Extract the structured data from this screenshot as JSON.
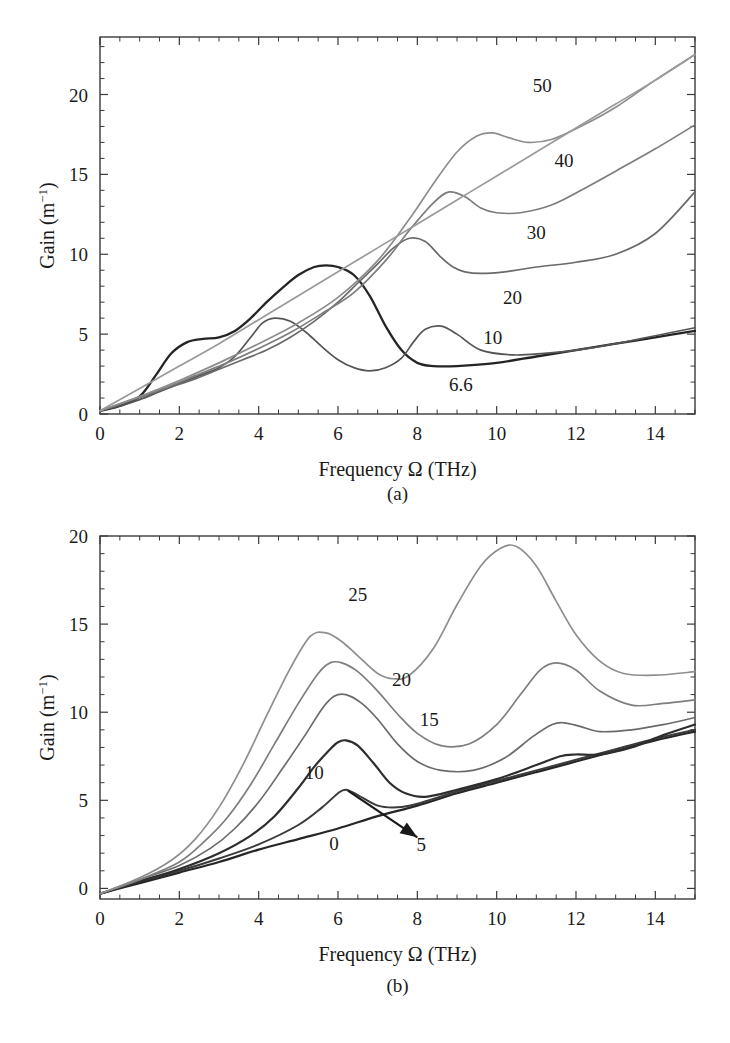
{
  "figure": {
    "caption_a": "(a)",
    "caption_b": "(b)"
  },
  "panel_a": {
    "xlabel_pre": "Frequency ",
    "xlabel_omega": "Ω",
    "xlabel_post": " (THz)",
    "ylabel_pre": "Gain (m",
    "ylabel_sup": "−1",
    "ylabel_post": ")",
    "xticks": [
      "0",
      "2",
      "4",
      "6",
      "8",
      "10",
      "12",
      "14"
    ],
    "yticks": [
      "0",
      "5",
      "10",
      "15",
      "20"
    ],
    "curve_labels": [
      "50",
      "40",
      "30",
      "20",
      "10",
      "6.6"
    ]
  },
  "panel_b": {
    "xlabel_pre": "Frequency ",
    "xlabel_omega": "Ω",
    "xlabel_post": " (THz)",
    "ylabel_pre": "Gain (m",
    "ylabel_sup": "−1",
    "ylabel_post": ")",
    "xticks": [
      "0",
      "2",
      "4",
      "6",
      "8",
      "10",
      "12",
      "14"
    ],
    "yticks": [
      "0",
      "5",
      "10",
      "15",
      "20"
    ],
    "curve_labels": [
      "25",
      "20",
      "15",
      "10",
      "0",
      "5"
    ]
  },
  "chart_data": [
    {
      "panel": "(a)",
      "type": "line",
      "title": "",
      "xlabel": "Frequency Ω (THz)",
      "ylabel": "Gain (m⁻¹)",
      "xlim": [
        0,
        15
      ],
      "ylim": [
        0,
        23.6
      ],
      "xticks": [
        0,
        2,
        4,
        6,
        8,
        10,
        12,
        14
      ],
      "yticks": [
        0,
        5,
        10,
        15,
        20
      ],
      "minor_tick_step_x": 0.5,
      "minor_tick_step_y": 1,
      "grid": false,
      "legend": "inline curve labels",
      "series": [
        {
          "name": "6.6",
          "color": "#242424",
          "width": 2.3,
          "x": [
            0,
            0.5,
            1.0,
            1.4,
            1.8,
            2.2,
            2.6,
            3.0,
            3.4,
            3.8,
            4.2,
            4.6,
            5.0,
            5.4,
            5.7,
            6.0,
            6.4,
            6.8,
            7.2,
            7.6,
            8.0,
            8.4,
            9.0,
            10.0,
            11.0,
            12.0,
            13.0,
            14.0,
            15.0
          ],
          "y": [
            0.2,
            0.5,
            1.1,
            2.4,
            3.8,
            4.5,
            4.7,
            4.8,
            5.2,
            6.0,
            7.0,
            7.9,
            8.7,
            9.2,
            9.3,
            9.2,
            8.7,
            7.4,
            5.5,
            4.0,
            3.2,
            3.0,
            3.0,
            3.2,
            3.6,
            4.0,
            4.4,
            4.8,
            5.2
          ]
        },
        {
          "name": "10",
          "color": "#555555",
          "width": 1.7,
          "x": [
            0,
            0.5,
            1.0,
            1.5,
            2.0,
            2.5,
            3.0,
            3.4,
            3.8,
            4.1,
            4.4,
            4.8,
            5.2,
            5.6,
            6.0,
            6.4,
            6.8,
            7.2,
            7.6,
            7.9,
            8.2,
            8.6,
            9.0,
            9.6,
            10.4,
            11.2,
            12.0,
            13.0,
            14.0,
            15.0
          ],
          "y": [
            0.2,
            0.5,
            0.9,
            1.4,
            1.9,
            2.4,
            2.9,
            3.6,
            4.8,
            5.7,
            6.0,
            5.8,
            5.1,
            4.2,
            3.4,
            2.9,
            2.7,
            2.9,
            3.5,
            4.5,
            5.3,
            5.5,
            5.0,
            4.0,
            3.7,
            3.8,
            4.0,
            4.4,
            4.9,
            5.4
          ]
        },
        {
          "name": "20",
          "color": "#6a6a6a",
          "width": 1.7,
          "x": [
            0,
            0.6,
            1.2,
            1.8,
            2.4,
            3.0,
            3.6,
            4.2,
            4.8,
            5.4,
            6.0,
            6.5,
            7.0,
            7.4,
            7.8,
            8.2,
            8.6,
            8.9,
            9.2,
            9.6,
            10.2,
            11.0,
            12.0,
            13.0,
            14.0,
            15.0
          ],
          "y": [
            0.2,
            0.7,
            1.2,
            1.7,
            2.2,
            2.8,
            3.4,
            4.0,
            4.8,
            5.8,
            7.0,
            8.2,
            9.4,
            10.4,
            11.0,
            10.8,
            9.8,
            9.2,
            8.9,
            8.8,
            8.9,
            9.2,
            9.5,
            10.0,
            11.3,
            13.9
          ]
        },
        {
          "name": "30",
          "color": "#7d7d7d",
          "width": 1.7,
          "x": [
            0,
            0.8,
            1.6,
            2.4,
            3.2,
            4.0,
            4.8,
            5.6,
            6.4,
            7.2,
            7.8,
            8.4,
            8.8,
            9.2,
            9.6,
            10.0,
            10.6,
            11.4,
            12.2,
            13.0,
            14.0,
            15.0
          ],
          "y": [
            0.2,
            0.9,
            1.6,
            2.4,
            3.2,
            4.1,
            5.1,
            6.3,
            7.6,
            9.6,
            11.5,
            13.2,
            13.9,
            13.6,
            12.9,
            12.6,
            12.6,
            13.1,
            14.1,
            15.2,
            16.6,
            18.1
          ]
        },
        {
          "name": "40",
          "color": "#8d8d8d",
          "width": 1.7,
          "x": [
            0,
            1.0,
            2.0,
            3.0,
            4.0,
            5.0,
            6.0,
            7.0,
            7.8,
            8.4,
            9.0,
            9.5,
            9.9,
            10.3,
            10.8,
            11.4,
            12.2,
            13.0,
            14.0,
            15.0
          ],
          "y": [
            0.2,
            1.1,
            2.1,
            3.2,
            4.4,
            5.7,
            7.3,
            9.6,
            12.2,
            14.4,
            16.4,
            17.4,
            17.6,
            17.3,
            17.0,
            17.2,
            18.1,
            19.2,
            20.9,
            22.5
          ]
        },
        {
          "name": "50",
          "color": "#9a9a9a",
          "width": 1.7,
          "x": [
            0,
            1.0,
            2.0,
            3.0,
            4.0,
            5.0,
            6.0,
            7.0,
            8.0,
            9.0,
            10.0,
            11.0,
            12.0,
            13.0,
            14.0,
            15.0
          ],
          "y": [
            0.2,
            1.6,
            3.0,
            4.4,
            5.9,
            7.4,
            8.9,
            10.4,
            11.9,
            13.4,
            14.9,
            16.4,
            17.9,
            19.4,
            20.9,
            22.5
          ]
        }
      ],
      "annotations": [
        {
          "text": "50",
          "x": 11.15,
          "y": 20.6
        },
        {
          "text": "40",
          "x": 11.7,
          "y": 15.9
        },
        {
          "text": "30",
          "x": 11.0,
          "y": 11.4
        },
        {
          "text": "20",
          "x": 10.4,
          "y": 7.3
        },
        {
          "text": "10",
          "x": 9.9,
          "y": 4.8
        },
        {
          "text": "6.6",
          "x": 9.1,
          "y": 1.9
        }
      ]
    },
    {
      "panel": "(b)",
      "type": "line",
      "title": "",
      "xlabel": "Frequency Ω (THz)",
      "ylabel": "Gain (m⁻¹)",
      "xlim": [
        0,
        15
      ],
      "ylim": [
        -0.6,
        20
      ],
      "xticks": [
        0,
        2,
        4,
        6,
        8,
        10,
        12,
        14
      ],
      "yticks": [
        0,
        5,
        10,
        15,
        20
      ],
      "minor_tick_step_x": 0.5,
      "minor_tick_step_y": 1,
      "grid": false,
      "legend": "inline curve labels",
      "series": [
        {
          "name": "0",
          "color": "#262626",
          "width": 2.2,
          "x": [
            0,
            1,
            2,
            3,
            4,
            5,
            6,
            7,
            8,
            9,
            10,
            11,
            12,
            13,
            14,
            15
          ],
          "y": [
            -0.3,
            0.3,
            0.9,
            1.5,
            2.2,
            2.8,
            3.4,
            4.1,
            4.7,
            5.4,
            6.0,
            6.6,
            7.2,
            7.8,
            8.4,
            8.9
          ]
        },
        {
          "name": "5",
          "color": "#3a3a3a",
          "width": 2.0,
          "x": [
            0,
            1,
            2,
            3,
            4,
            5,
            5.6,
            6.0,
            6.2,
            6.5,
            7.0,
            7.5,
            8,
            9,
            10,
            11,
            12,
            13,
            14,
            15
          ],
          "y": [
            -0.3,
            0.4,
            1.0,
            1.7,
            2.5,
            3.6,
            4.6,
            5.4,
            5.6,
            5.3,
            4.7,
            4.6,
            4.8,
            5.5,
            6.1,
            6.7,
            7.3,
            7.9,
            8.5,
            9.0
          ]
        },
        {
          "name": "10",
          "color": "#2e2e2e",
          "width": 2.2,
          "x": [
            0,
            1,
            2,
            3,
            3.8,
            4.4,
            5.0,
            5.4,
            5.8,
            6.0,
            6.2,
            6.5,
            6.9,
            7.3,
            7.7,
            8.2,
            9.0,
            10.0,
            11.0,
            11.6,
            12.0,
            12.6,
            13.4,
            14.2,
            15.0
          ],
          "y": [
            -0.3,
            0.4,
            1.1,
            2.0,
            3.0,
            4.1,
            5.7,
            6.9,
            7.9,
            8.3,
            8.4,
            8.1,
            7.1,
            6.0,
            5.4,
            5.2,
            5.6,
            6.2,
            7.0,
            7.5,
            7.6,
            7.6,
            8.0,
            8.7,
            9.3
          ]
        },
        {
          "name": "15",
          "color": "#6a6a6a",
          "width": 1.7,
          "x": [
            0,
            1,
            2,
            2.8,
            3.4,
            4.0,
            4.6,
            5.2,
            5.6,
            5.9,
            6.2,
            6.6,
            7.0,
            7.5,
            8.0,
            8.6,
            9.4,
            10.2,
            10.9,
            11.4,
            11.7,
            12.1,
            12.6,
            13.4,
            14.2,
            15.0
          ],
          "y": [
            -0.3,
            0.5,
            1.3,
            2.3,
            3.4,
            4.9,
            6.8,
            8.8,
            10.2,
            10.9,
            11.0,
            10.5,
            9.6,
            8.2,
            7.2,
            6.7,
            6.7,
            7.4,
            8.6,
            9.3,
            9.4,
            9.2,
            8.9,
            9.0,
            9.3,
            9.7
          ]
        },
        {
          "name": "20",
          "color": "#7e7e7e",
          "width": 1.7,
          "x": [
            0,
            1,
            2,
            2.6,
            3.2,
            3.8,
            4.4,
            5.0,
            5.5,
            5.8,
            6.1,
            6.5,
            7.0,
            7.5,
            8.0,
            8.6,
            9.3,
            10.0,
            10.6,
            11.1,
            11.5,
            12.0,
            12.6,
            13.4,
            14.2,
            15.0
          ],
          "y": [
            -0.3,
            0.5,
            1.5,
            2.6,
            4.0,
            5.9,
            8.2,
            10.5,
            12.2,
            12.8,
            12.8,
            12.3,
            11.2,
            9.9,
            8.8,
            8.1,
            8.2,
            9.3,
            11.0,
            12.4,
            12.8,
            12.4,
            11.2,
            10.4,
            10.5,
            10.7
          ]
        },
        {
          "name": "25",
          "color": "#8e8e8e",
          "width": 1.7,
          "x": [
            0,
            1,
            1.8,
            2.4,
            3.0,
            3.6,
            4.2,
            4.8,
            5.3,
            5.7,
            6.1,
            6.5,
            7.0,
            7.4,
            7.8,
            8.4,
            9.0,
            9.6,
            10.1,
            10.5,
            11.0,
            11.5,
            12.0,
            12.6,
            13.2,
            14.0,
            15.0
          ],
          "y": [
            -0.3,
            0.6,
            1.6,
            2.8,
            4.6,
            7.0,
            9.8,
            12.5,
            14.3,
            14.5,
            14.0,
            13.2,
            12.2,
            11.9,
            12.1,
            13.6,
            16.1,
            18.3,
            19.3,
            19.4,
            18.3,
            16.3,
            14.4,
            12.9,
            12.2,
            12.1,
            12.3
          ]
        }
      ],
      "annotations": [
        {
          "text": "25",
          "x": 6.5,
          "y": 16.7
        },
        {
          "text": "20",
          "x": 7.6,
          "y": 11.9
        },
        {
          "text": "15",
          "x": 8.3,
          "y": 9.6
        },
        {
          "text": "10",
          "x": 5.4,
          "y": 6.6
        },
        {
          "text": "0",
          "x": 5.9,
          "y": 2.6
        },
        {
          "text": "5",
          "x": 8.1,
          "y": 2.5
        }
      ],
      "arrow": {
        "from_x": 8.0,
        "from_y": 2.9,
        "to_x": 6.25,
        "to_y": 5.55
      }
    }
  ]
}
